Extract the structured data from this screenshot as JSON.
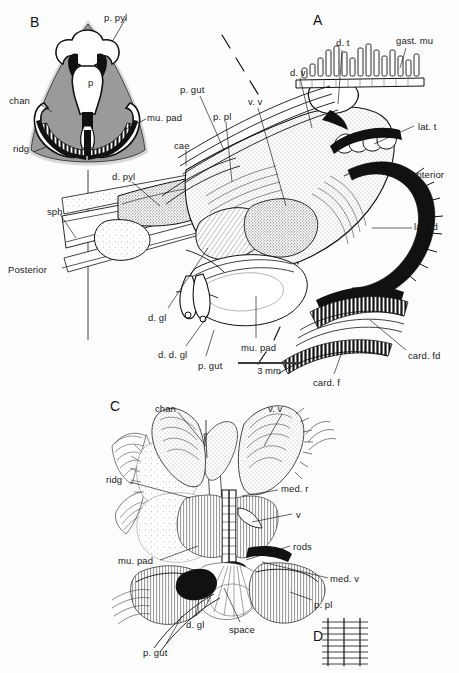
{
  "figure": {
    "background_color": "#fdfdfd",
    "ink_color": "#111111",
    "tissue_gray": "#9a9a9a",
    "panels": [
      {
        "id": "panel-a",
        "letter": "A",
        "x": 313,
        "y": 12
      },
      {
        "id": "panel-b",
        "letter": "B",
        "x": 30,
        "y": 14
      },
      {
        "id": "panel-c",
        "letter": "C",
        "x": 110,
        "y": 398
      },
      {
        "id": "panel-d",
        "letter": "D",
        "x": 313,
        "y": 628
      }
    ],
    "scalebar": {
      "label": "3 mm",
      "x": 238,
      "y": 362,
      "length_px": 62
    },
    "labels": [
      {
        "id": "b-p-pyl",
        "text": "p. pyl",
        "x": 104,
        "y": 13,
        "panel": "B"
      },
      {
        "id": "b-chan",
        "text": "chan",
        "x": 9,
        "y": 96,
        "panel": "B"
      },
      {
        "id": "b-mu-pad",
        "text": "mu. pad",
        "x": 147,
        "y": 113,
        "panel": "B"
      },
      {
        "id": "b-ridg",
        "text": "ridg",
        "x": 13,
        "y": 144,
        "panel": "B"
      },
      {
        "id": "b-p",
        "text": "p",
        "x": 88,
        "y": 78,
        "panel": "B"
      },
      {
        "id": "a-letter-note",
        "text": "",
        "x": 0,
        "y": 0,
        "panel": "A"
      },
      {
        "id": "a-p-gut",
        "text": "p. gut",
        "x": 180,
        "y": 85,
        "panel": "A"
      },
      {
        "id": "a-cae",
        "text": "cae",
        "x": 174,
        "y": 141,
        "panel": "A"
      },
      {
        "id": "a-d-pyl",
        "text": "d. pyl",
        "x": 112,
        "y": 172,
        "panel": "A"
      },
      {
        "id": "a-sph",
        "text": "sph",
        "x": 47,
        "y": 207,
        "panel": "A"
      },
      {
        "id": "a-posterior",
        "text": "Posterior",
        "x": 8,
        "y": 265,
        "panel": "A"
      },
      {
        "id": "a-d-gl",
        "text": "d. gl",
        "x": 148,
        "y": 313,
        "panel": "A"
      },
      {
        "id": "a-d-d-gl",
        "text": "d. d. gl",
        "x": 158,
        "y": 350,
        "panel": "A"
      },
      {
        "id": "a-p-gut-2",
        "text": "p. gut",
        "x": 198,
        "y": 361,
        "panel": "A"
      },
      {
        "id": "a-p-pl",
        "text": "p. pl",
        "x": 213,
        "y": 112,
        "panel": "A"
      },
      {
        "id": "a-v-v",
        "text": "v. v",
        "x": 248,
        "y": 97,
        "panel": "A"
      },
      {
        "id": "a-d-v",
        "text": "d. v",
        "x": 290,
        "y": 68,
        "panel": "A"
      },
      {
        "id": "a-d-t",
        "text": "d. t",
        "x": 336,
        "y": 38,
        "panel": "A"
      },
      {
        "id": "a-gast-mu",
        "text": "gast. mu",
        "x": 396,
        "y": 36,
        "panel": "A"
      },
      {
        "id": "a-lat-t",
        "text": "lat. t",
        "x": 418,
        "y": 122,
        "panel": "A"
      },
      {
        "id": "a-anterior",
        "text": "Anterior",
        "x": 410,
        "y": 170,
        "panel": "A"
      },
      {
        "id": "a-lat-fd",
        "text": "lat. fd",
        "x": 414,
        "y": 222,
        "panel": "A"
      },
      {
        "id": "a-card-fd",
        "text": "card. fd",
        "x": 408,
        "y": 351,
        "panel": "A"
      },
      {
        "id": "a-card-f",
        "text": "card. f",
        "x": 313,
        "y": 378,
        "panel": "A"
      },
      {
        "id": "a-mu-pad",
        "text": "mu. pad",
        "x": 241,
        "y": 343,
        "panel": "A"
      },
      {
        "id": "c-chan",
        "text": "chan",
        "x": 155,
        "y": 404,
        "panel": "C"
      },
      {
        "id": "c-v-v",
        "text": "v. v",
        "x": 268,
        "y": 404,
        "panel": "C"
      },
      {
        "id": "c-ridg",
        "text": "ridg",
        "x": 106,
        "y": 475,
        "panel": "C"
      },
      {
        "id": "c-med-r",
        "text": "med. r",
        "x": 281,
        "y": 484,
        "panel": "C"
      },
      {
        "id": "c-v",
        "text": "v",
        "x": 296,
        "y": 510,
        "panel": "C"
      },
      {
        "id": "c-rods",
        "text": "rods",
        "x": 293,
        "y": 542,
        "panel": "C"
      },
      {
        "id": "c-mu-pad",
        "text": "mu. pad",
        "x": 118,
        "y": 556,
        "panel": "C"
      },
      {
        "id": "c-med-v",
        "text": "med. v",
        "x": 330,
        "y": 574,
        "panel": "C"
      },
      {
        "id": "c-p-pl",
        "text": "p. pl",
        "x": 314,
        "y": 600,
        "panel": "C"
      },
      {
        "id": "c-d-gl",
        "text": "d. gl",
        "x": 186,
        "y": 620,
        "panel": "C"
      },
      {
        "id": "c-space",
        "text": "space",
        "x": 229,
        "y": 625,
        "panel": "C"
      },
      {
        "id": "c-p-gut",
        "text": "p. gut",
        "x": 143,
        "y": 648,
        "panel": "C"
      }
    ],
    "abbreviations": [
      "p. pyl",
      "chan",
      "ridg",
      "mu. pad",
      "p",
      "p. gut",
      "cae",
      "d. pyl",
      "sph",
      "Posterior",
      "Anterior",
      "d. gl",
      "d. d. gl",
      "p. pl",
      "v. v",
      "d. v",
      "d. t",
      "gast. mu",
      "lat. t",
      "lat. fd",
      "card. fd",
      "card. f",
      "med. r",
      "v",
      "rods",
      "med. v",
      "space"
    ]
  }
}
